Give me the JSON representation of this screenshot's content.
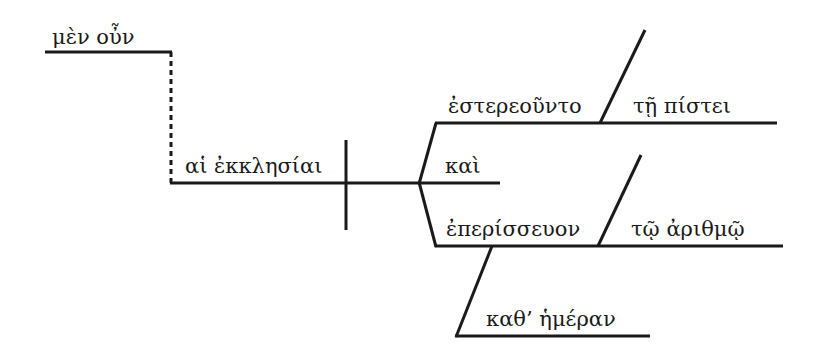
{
  "diagram": {
    "type": "sentence-diagram",
    "language": "Greek",
    "words": {
      "particle": "μὲν οὖν",
      "subject": "αἱ ἐκκλησίαι",
      "conjunction": "καὶ",
      "verb1": "ἐστερεοῦντο",
      "modifier1": "τῇ πίστει",
      "verb2": "ἐπερίσσευον",
      "modifier2": "τῷ ἀριθμῷ",
      "modifier3": "καθ’ ἡμέραν"
    },
    "colors": {
      "ink": "#1a1a1a",
      "background": "#ffffff"
    }
  }
}
